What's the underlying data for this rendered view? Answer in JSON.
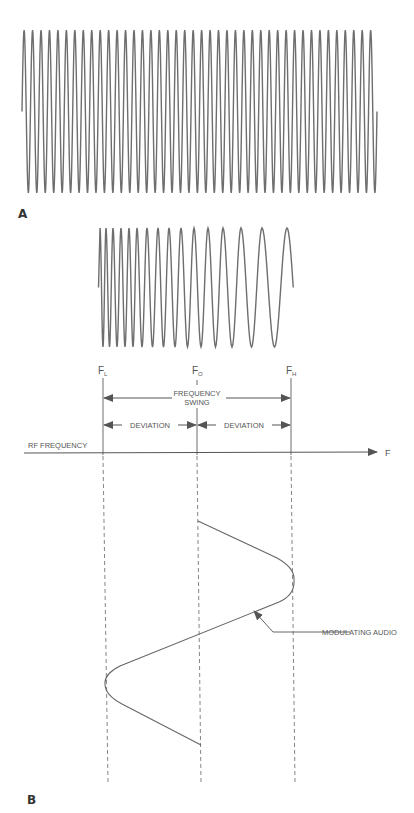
{
  "figure": {
    "panel_a": {
      "label": "A",
      "waveform": {
        "type": "constant-frequency carrier",
        "cycles": 42,
        "x_start": 22,
        "x_end": 377,
        "y_top": 30,
        "y_bottom": 193
      }
    },
    "panel_b": {
      "label": "B",
      "waveform": {
        "type": "frequency-modulated carrier (decreasing frequency)",
        "peak_x": [
          100,
          106,
          113,
          121,
          129,
          137,
          147,
          158,
          169,
          181,
          194,
          208,
          223,
          241,
          262,
          287
        ],
        "y_top": 228,
        "y_bottom": 347
      },
      "markers": {
        "f_low": {
          "letter": "F",
          "sub": "L"
        },
        "f_center": {
          "letter": "F",
          "sub": "O"
        },
        "f_high": {
          "letter": "F",
          "sub": "H"
        }
      },
      "frequency_swing": {
        "line1": "FREQUENCY",
        "line2": "SWING"
      },
      "deviation_left": "DEVIATION",
      "deviation_right": "DEVIATION",
      "axis": {
        "label": "RF FREQUENCY",
        "end_label": "F"
      },
      "callout": "MODULATING AUDIO"
    },
    "colors": {
      "line": "#6e6e6e",
      "text": "#555555",
      "background": "#ffffff"
    }
  }
}
